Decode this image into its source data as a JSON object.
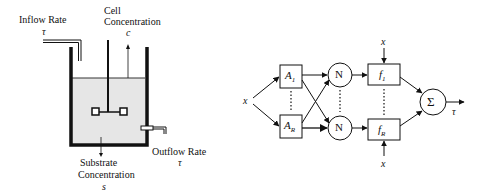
{
  "bioreactor": {
    "inflow_label": "Inflow Rate",
    "inflow_symbol": "τ",
    "cell_label_line1": "Cell",
    "cell_label_line2": "Concentration",
    "cell_symbol": "c",
    "outflow_label": "Outflow Rate",
    "outflow_symbol": "τ",
    "substrate_label_line1": "Substrate",
    "substrate_label_line2": "Concentration",
    "substrate_symbol": "s",
    "liquid_color": "#e6e6e6",
    "wall_color": "#111111"
  },
  "network": {
    "input_symbol": "x",
    "box_top": {
      "main": "A",
      "sub": "1"
    },
    "box_bottom": {
      "main": "A",
      "sub": "R"
    },
    "node_top": "N",
    "node_bottom": "N",
    "func_top": {
      "main": "f",
      "sub": "1"
    },
    "func_bottom": {
      "main": "f",
      "sub": "R"
    },
    "func_top_input": "x",
    "func_bottom_input": "x",
    "sum_symbol": "Σ",
    "output_symbol": "τ"
  }
}
